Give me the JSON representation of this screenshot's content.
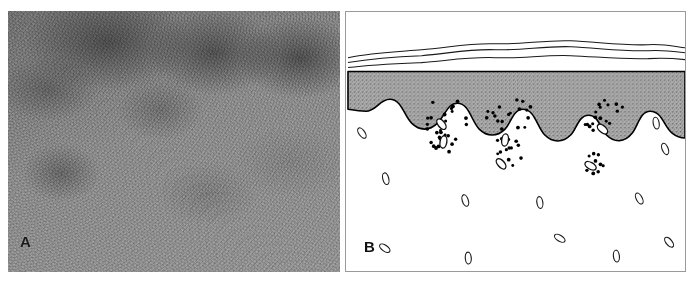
{
  "figure": {
    "type": "two-panel-medical-figure",
    "background_color": "#ffffff",
    "width": 699,
    "height": 286
  },
  "panel_a": {
    "label": "A",
    "kind": "photomicrograph",
    "description": "grayscale histology photomicrograph with mottled darker cellular infiltrate in upper region",
    "dominant_color": "#8e8e8e",
    "dark_tone": "#4a4a4a",
    "light_tone": "#b4b4b4"
  },
  "panel_b": {
    "label": "B",
    "kind": "line-art-schematic",
    "description": "schematic cross-section of skin showing hyperkeratotic scale, thickened epidermis, elongated rete ridges, dilated papillary capillaries and perivascular inflammatory infiltrate",
    "colors": {
      "epidermis_fill": "#a8a8a8",
      "outline": "#000000",
      "dermis_fill": "#ffffff",
      "frame": "#9a9a9a",
      "infiltrate_dot": "#000000",
      "vessel_outline": "#1a1a1a"
    },
    "layers": [
      {
        "name": "stratum-corneum",
        "style": "three thin parallel wavy lines",
        "line_count": 3
      },
      {
        "name": "epidermis",
        "style": "gray stippled band with undulating lower border"
      },
      {
        "name": "rete-ridges",
        "style": "bulbous downward epidermal projections",
        "count": 6
      },
      {
        "name": "dermal-papillae",
        "style": "white upward projections containing dilated capillary loops",
        "count": 5
      },
      {
        "name": "inflammatory-infiltrate",
        "style": "clusters of small black dots",
        "cluster_count": 6
      },
      {
        "name": "dermal-vessels",
        "style": "small elongated oval outlines",
        "count": 14
      }
    ],
    "corneum_lines": [
      "M 2,46 C 26,41 52,40 76,38 C 102,36 124,31 150,32 C 176,33 200,28 226,29 C 252,30 278,34 304,33 C 320,32 332,35 341,36",
      "M 2,51 C 26,47 52,45 76,44 C 102,42 124,37 150,38 C 176,39 200,34 226,35 C 252,36 278,40 304,39 C 320,38 332,40 341,41",
      "M 2,56 C 26,53 52,52 76,51 C 102,49 124,45 150,46 C 176,47 200,43 226,44 C 252,45 278,48 304,47 C 320,46 332,47 341,48"
    ],
    "dermo_epidermal_junction": "M 2,60 L 2,98 C 8,99 14,100 20,100 C 30,100 34,88 44,88 C 56,88 58,104 66,112 C 74,120 84,120 92,112 C 100,104 102,92 112,92 C 124,92 126,110 134,118 C 142,126 152,126 160,118 C 166,112 168,98 178,98 C 190,98 192,116 200,124 C 208,132 218,132 226,124 C 232,118 234,104 244,104 C 254,104 256,118 262,124 C 270,132 280,132 288,122 C 294,114 296,100 306,100 C 318,100 320,116 328,122 C 333,126 338,127 341,127 L 341,60 Z",
    "infiltrate_clusters": [
      {
        "cx": 100,
        "cy": 106,
        "n": 17,
        "rx": 24,
        "ry": 19
      },
      {
        "cx": 96,
        "cy": 131,
        "n": 11,
        "rx": 17,
        "ry": 12
      },
      {
        "cx": 165,
        "cy": 104,
        "n": 18,
        "rx": 25,
        "ry": 18
      },
      {
        "cx": 160,
        "cy": 141,
        "n": 14,
        "rx": 20,
        "ry": 15
      },
      {
        "cx": 259,
        "cy": 104,
        "n": 17,
        "rx": 24,
        "ry": 18
      },
      {
        "cx": 248,
        "cy": 152,
        "n": 11,
        "rx": 16,
        "ry": 12
      }
    ],
    "papillary_vessels": [
      {
        "cx": 96,
        "cy": 113,
        "angle": -38
      },
      {
        "cx": 98,
        "cy": 131,
        "angle": 10
      },
      {
        "cx": 160,
        "cy": 129,
        "angle": 8
      },
      {
        "cx": 156,
        "cy": 153,
        "angle": -42
      },
      {
        "cx": 258,
        "cy": 118,
        "angle": -48
      },
      {
        "cx": 246,
        "cy": 155,
        "angle": -60
      }
    ],
    "dermal_vessels": [
      {
        "cx": 16,
        "cy": 122,
        "angle": -35
      },
      {
        "cx": 312,
        "cy": 112,
        "angle": -10
      },
      {
        "cx": 321,
        "cy": 138,
        "angle": -22
      },
      {
        "cx": 40,
        "cy": 168,
        "angle": -14
      },
      {
        "cx": 120,
        "cy": 190,
        "angle": -18
      },
      {
        "cx": 195,
        "cy": 192,
        "angle": -8
      },
      {
        "cx": 295,
        "cy": 188,
        "angle": -28
      },
      {
        "cx": 215,
        "cy": 228,
        "angle": -58
      },
      {
        "cx": 39,
        "cy": 238,
        "angle": -55
      },
      {
        "cx": 123,
        "cy": 248,
        "angle": -4
      },
      {
        "cx": 272,
        "cy": 246,
        "angle": -6
      },
      {
        "cx": 325,
        "cy": 232,
        "angle": -40
      }
    ]
  }
}
